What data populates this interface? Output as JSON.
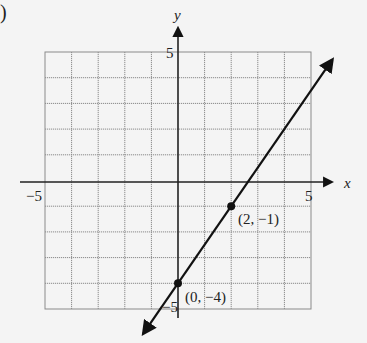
{
  "figure": {
    "part_label": ")",
    "point_a_label": "(2, −1)",
    "point_b_label": "(0, −4)"
  },
  "chart_data": {
    "type": "line",
    "title": "",
    "xlabel": "x",
    "ylabel": "y",
    "xlim": [
      -5,
      5
    ],
    "ylim": [
      -5,
      5
    ],
    "grid": true,
    "grid_step": 1,
    "x_tick_labels": [
      "−5",
      "5"
    ],
    "y_tick_labels": [
      "5",
      "−5"
    ],
    "series": [
      {
        "name": "line",
        "equation": "y = (3/2)x - 4",
        "slope": 1.5,
        "intercept": -4,
        "arrows_both_ends": true,
        "x": [
          -1.3,
          5.8
        ],
        "y": [
          -5.95,
          4.7
        ]
      }
    ],
    "points": [
      {
        "x": 2,
        "y": -1,
        "label": "(2, −1)"
      },
      {
        "x": 0,
        "y": -4,
        "label": "(0, −4)"
      }
    ],
    "colors": {
      "grid": "#8a8a8a",
      "axes": "#222222",
      "line": "#111111",
      "background": "#f4f4f4"
    }
  }
}
